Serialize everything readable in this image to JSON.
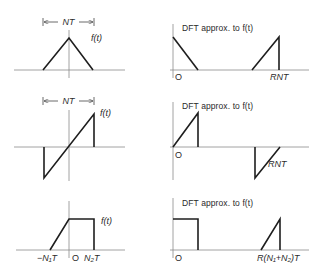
{
  "figure": {
    "rows": [
      {
        "left": {
          "function_label": "f(t)",
          "width_label": "NT",
          "shape": "triangle"
        },
        "right": {
          "title": "DFT approx. to f(t)",
          "origin_label": "O",
          "end_label": "RNT",
          "shape": "half-triangles at both ends of period"
        }
      },
      {
        "left": {
          "function_label": "f(t)",
          "width_label": "NT",
          "shape": "sawtooth (odd ramp)"
        },
        "right": {
          "title": "DFT approx. to f(t)",
          "origin_label": "O",
          "end_label": "RNT",
          "shape": "positive ramp at start, negative ramp at end"
        }
      },
      {
        "left": {
          "function_label": "f(t)",
          "tick_labels": [
            "−N₁T",
            "O",
            "N₂T"
          ],
          "shape": "ramp then flat top"
        },
        "right": {
          "title": "DFT approx. to f(t)",
          "origin_label": "O",
          "end_label": "R(N₁+N₂)T",
          "shape": "flat top at start, ramp at end"
        }
      }
    ]
  }
}
